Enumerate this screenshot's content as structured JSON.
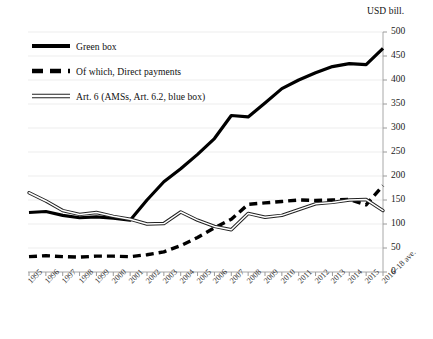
{
  "chart_data": {
    "type": "line",
    "title": "",
    "subtitle": "",
    "ylabel": "USD bill.",
    "xlabel": "",
    "ylim": [
      0,
      500
    ],
    "ytick_step": 50,
    "yticks": [
      "0",
      "50",
      "100",
      "150",
      "200",
      "250",
      "300",
      "350",
      "400",
      "450",
      "500"
    ],
    "grid": true,
    "grid_axis": "y",
    "legend_position": "top-left",
    "categories": [
      "1995",
      "1996",
      "1997",
      "1998",
      "1999",
      "2000",
      "2001",
      "2002",
      "2003",
      "2004",
      "2005",
      "2006",
      "2007",
      "2008",
      "2009",
      "2010",
      "2011",
      "2012",
      "2013",
      "2014",
      "2015",
      "2016–18 ave."
    ],
    "series": [
      {
        "name": "Green box",
        "style": "solid-thick",
        "color": "#000000",
        "values": [
          124,
          126,
          118,
          113,
          115,
          112,
          108,
          150,
          188,
          215,
          245,
          278,
          326,
          323,
          352,
          382,
          400,
          415,
          428,
          434,
          432,
          466
        ]
      },
      {
        "name": "Of which, Direct payments",
        "style": "dashed-thick",
        "color": "#000000",
        "values": [
          32,
          34,
          32,
          31,
          33,
          33,
          32,
          36,
          42,
          55,
          72,
          92,
          110,
          141,
          144,
          147,
          150,
          149,
          150,
          151,
          140,
          180
        ]
      },
      {
        "name": "Art. 6 (AMSs, Art. 6.2, blue box)",
        "style": "double-thin",
        "color": "#222222",
        "values": [
          165,
          148,
          128,
          120,
          124,
          116,
          110,
          100,
          101,
          125,
          108,
          95,
          88,
          122,
          114,
          118,
          130,
          142,
          145,
          150,
          151,
          128
        ]
      }
    ]
  },
  "legend": {
    "items": [
      {
        "label": "Green box",
        "swatch": "solid-thick-swatch"
      },
      {
        "label": "Of which, Direct payments",
        "swatch": "dashed-thick-swatch"
      },
      {
        "label": "Art. 6 (AMSs, Art. 6.2, blue box)",
        "swatch": "double-thin-swatch"
      }
    ]
  },
  "axes": {
    "y_unit_label": "USD bill."
  }
}
